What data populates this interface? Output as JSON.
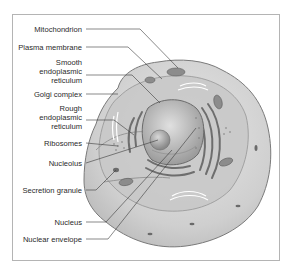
{
  "figure": {
    "labels": [
      {
        "id": "mitochondrion",
        "text": "Mitochondrion"
      },
      {
        "id": "plasma-membrane",
        "text": "Plasma membrane"
      },
      {
        "id": "smooth-er",
        "text": "Smooth\nendoplasmic\nreticulum"
      },
      {
        "id": "golgi-complex",
        "text": "Golgi complex"
      },
      {
        "id": "rough-er",
        "text": "Rough\nendoplasmic\nreticulum"
      },
      {
        "id": "ribosomes",
        "text": "Ribosomes"
      },
      {
        "id": "nucleolus",
        "text": "Nucleolus"
      },
      {
        "id": "secretion-granule",
        "text": "Secretion granule"
      },
      {
        "id": "nucleus",
        "text": "Nucleus"
      },
      {
        "id": "nuclear-envelope",
        "text": "Nuclear envelope"
      }
    ]
  },
  "colors": {
    "frame": "#b4b4b4",
    "cytoplasm": "#d2d2d2",
    "membrane": "#7a7a7a",
    "organelle": "#8c8c8c",
    "nucleus": "#bdbdbd",
    "leader": "#3a3a3a",
    "text": "#2a2a2a"
  }
}
